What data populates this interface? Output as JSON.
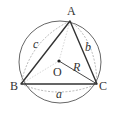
{
  "diagram": {
    "vertices": {
      "A": {
        "label": "A",
        "x": 70,
        "y": 21
      },
      "B": {
        "label": "B",
        "x": 21,
        "y": 84
      },
      "C": {
        "label": "C",
        "x": 97,
        "y": 84
      }
    },
    "center": {
      "label": "O",
      "x": 59,
      "y": 61
    },
    "circle": {
      "cx": 60,
      "cy": 62,
      "r": 41
    },
    "radius_label": "R",
    "sides": {
      "a": "a",
      "b": "b",
      "c": "c"
    },
    "colors": {
      "stroke": "#333333",
      "dashed": "#999999",
      "circle": "#555555"
    }
  }
}
